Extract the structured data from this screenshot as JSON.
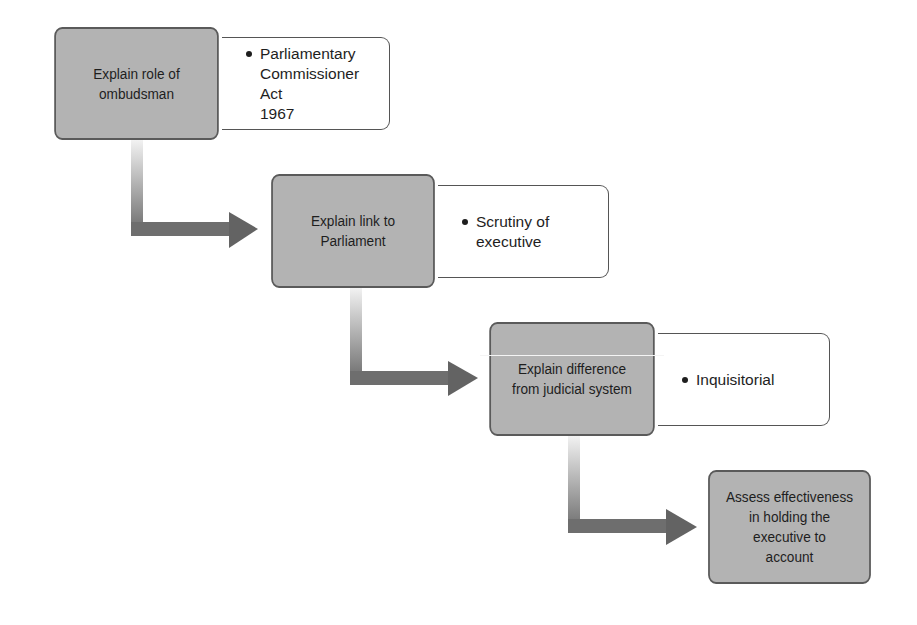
{
  "diagram": {
    "type": "stepped-flow",
    "steps": [
      {
        "label": "Explain role of\nombudsman",
        "note": "Parliamentary\nCommissioner Act\n1967"
      },
      {
        "label": "Explain link to\nParliament",
        "note": "Scrutiny of\nexecutive"
      },
      {
        "label": "Explain difference\nfrom judicial system",
        "note": "Inquisitorial"
      },
      {
        "label": "Assess effectiveness\nin holding the\nexecutive to\naccount"
      }
    ],
    "colors": {
      "step_fill": "#b3b3b3",
      "step_border": "#5a5a5a",
      "arrow": "#6e6e6e",
      "note_fill": "#ffffff"
    }
  }
}
